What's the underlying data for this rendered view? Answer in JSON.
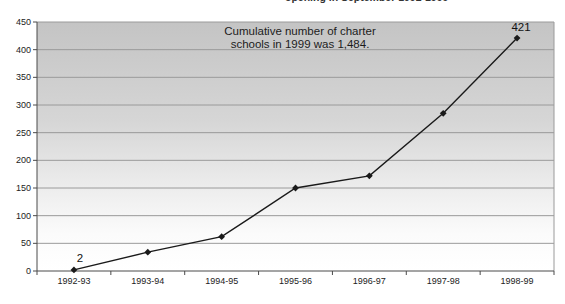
{
  "clipped_header": {
    "text": "opening in September 1992-1999"
  },
  "annotation": {
    "line1": "Cumulative number of charter",
    "line2": "schools in 1999 was 1,484."
  },
  "chart_data": {
    "type": "line",
    "title": "",
    "xlabel": "",
    "ylabel": "",
    "categories": [
      "1992-93",
      "1993-94",
      "1994-95",
      "1995-96",
      "1996-97",
      "1997-98",
      "1998-99"
    ],
    "values": [
      2,
      34,
      62,
      150,
      172,
      285,
      421
    ],
    "point_labels": {
      "first": "2",
      "last": "421"
    },
    "ylim": [
      0,
      450
    ],
    "ytick_step": 50,
    "yticks": [
      0,
      50,
      100,
      150,
      200,
      250,
      300,
      350,
      400,
      450
    ],
    "grid": true,
    "legend": "none",
    "marker": "diamond",
    "line_color": "#1a1a1a",
    "gridline_color": "#9a9a9a",
    "axis_color": "#4a4a4a",
    "plot_bg_gradient": [
      "#c4c4c4",
      "#ffffff"
    ]
  }
}
